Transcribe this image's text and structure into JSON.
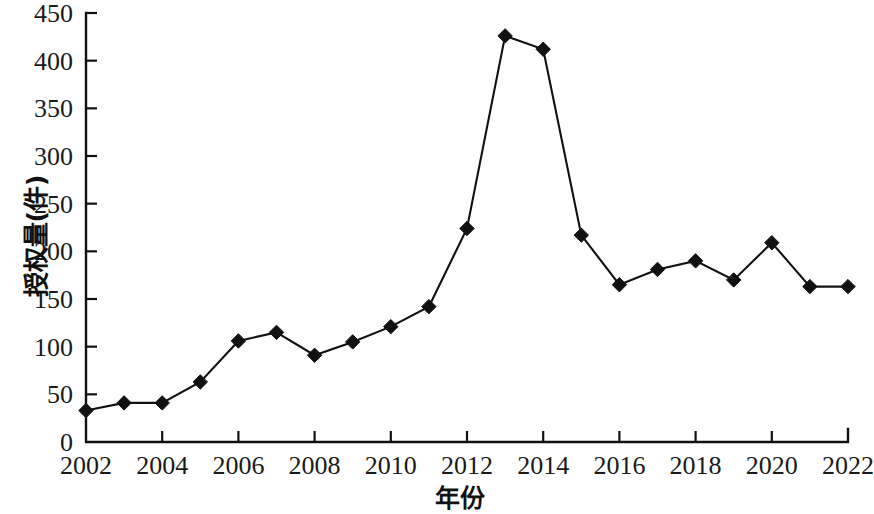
{
  "chart_data": {
    "type": "line",
    "title": "",
    "xlabel": "年份",
    "ylabel": "授权量(件)",
    "x": [
      2002,
      2003,
      2004,
      2005,
      2006,
      2007,
      2008,
      2009,
      2010,
      2011,
      2012,
      2013,
      2014,
      2015,
      2016,
      2017,
      2018,
      2019,
      2020,
      2021,
      2022
    ],
    "values": [
      33,
      41,
      41,
      63,
      106,
      115,
      91,
      105,
      121,
      142,
      224,
      426,
      412,
      217,
      165,
      181,
      190,
      170,
      209,
      163,
      163
    ],
    "series": [
      {
        "name": "授权量",
        "values": [
          33,
          41,
          41,
          63,
          106,
          115,
          91,
          105,
          121,
          142,
          224,
          426,
          412,
          217,
          165,
          181,
          190,
          170,
          209,
          163,
          163
        ]
      }
    ],
    "xlim": [
      2002,
      2022
    ],
    "ylim": [
      0,
      450
    ],
    "ytick_labels": [
      "0",
      "50",
      "100",
      "150",
      "200",
      "250",
      "300",
      "350",
      "400",
      "450"
    ],
    "ytick_values": [
      0,
      50,
      100,
      150,
      200,
      250,
      300,
      350,
      400,
      450
    ],
    "xtick_labels": [
      "2002",
      "2004",
      "2006",
      "2008",
      "2010",
      "2012",
      "2014",
      "2016",
      "2018",
      "2020",
      "2022"
    ],
    "xtick_values": [
      2002,
      2004,
      2006,
      2008,
      2010,
      2012,
      2014,
      2016,
      2018,
      2020,
      2022
    ],
    "grid": false,
    "legend": false,
    "legend_position": "none",
    "marker": "diamond",
    "line_color": "#111111",
    "marker_color": "#111111",
    "background_color": "#ffffff"
  }
}
